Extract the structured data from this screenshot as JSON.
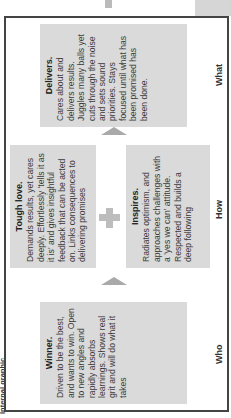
{
  "header": {
    "label": "Internal graphic"
  },
  "columns": [
    {
      "label": "Who"
    },
    {
      "label": "How"
    },
    {
      "label": "What"
    }
  ],
  "boxes": {
    "winner": {
      "title": "Winner.",
      "text": "Driven to be the best, and wants to win. Open to new angles and rapidly absorbs learnings. Shows real grit and will do what it takes"
    },
    "tough_love": {
      "title": "Tough love.",
      "text": "Demands results, yet cares deeply. Effortlessly 'tells it as it is' and gives insightful feedback that can be acted on. Links consequences to delivering promises"
    },
    "inspires": {
      "title": "Inspires.",
      "text": "Radiates optimism, and approaches challenges with a 'yes we can' attitude. Respected and builds a deep following"
    },
    "delivers": {
      "title": "Delivers.",
      "text": "Cares about and delivers results. Juggles many balls yet cuts through the noise and sets sound priorities. Stays focused until what has been promised has been done."
    }
  },
  "colors": {
    "box_bg": "#dadada",
    "arrow": "#a9a9a9",
    "plus": "#bdbdbd",
    "border": "#444444"
  }
}
